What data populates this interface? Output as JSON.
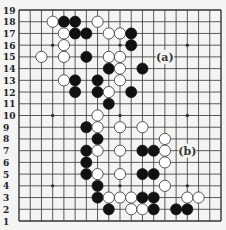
{
  "diagram": {
    "type": "go-board",
    "size": 19,
    "colors": {
      "background": "#f4f4f2",
      "line": "#333333",
      "black": "#111111",
      "white": "#ffffff"
    },
    "row_labels": [
      "19",
      "18",
      "17",
      "16",
      "15",
      "14",
      "13",
      "12",
      "11",
      "10",
      "9",
      "8",
      "7",
      "6",
      "5",
      "4",
      "3",
      "2",
      "1"
    ],
    "hoshi": [
      [
        4,
        4
      ],
      [
        4,
        10
      ],
      [
        4,
        16
      ],
      [
        10,
        4
      ],
      [
        10,
        10
      ],
      [
        10,
        16
      ],
      [
        16,
        4
      ],
      [
        16,
        10
      ],
      [
        16,
        16
      ]
    ],
    "stones": [
      {
        "c": 4,
        "r": 18,
        "color": "white"
      },
      {
        "c": 5,
        "r": 18,
        "color": "black"
      },
      {
        "c": 6,
        "r": 18,
        "color": "black"
      },
      {
        "c": 8,
        "r": 18,
        "color": "white"
      },
      {
        "c": 5,
        "r": 17,
        "color": "white"
      },
      {
        "c": 6,
        "r": 17,
        "color": "black"
      },
      {
        "c": 7,
        "r": 17,
        "color": "black"
      },
      {
        "c": 9,
        "r": 17,
        "color": "white"
      },
      {
        "c": 10,
        "r": 17,
        "color": "white"
      },
      {
        "c": 11,
        "r": 17,
        "color": "black"
      },
      {
        "c": 5,
        "r": 16,
        "color": "white"
      },
      {
        "c": 11,
        "r": 16,
        "color": "black"
      },
      {
        "c": 3,
        "r": 15,
        "color": "white"
      },
      {
        "c": 5,
        "r": 15,
        "color": "white"
      },
      {
        "c": 7,
        "r": 15,
        "color": "black"
      },
      {
        "c": 9,
        "r": 15,
        "color": "white"
      },
      {
        "c": 10,
        "r": 15,
        "color": "white"
      },
      {
        "c": 9,
        "r": 14,
        "color": "black"
      },
      {
        "c": 10,
        "r": 14,
        "color": "white"
      },
      {
        "c": 12,
        "r": 14,
        "color": "black"
      },
      {
        "c": 5,
        "r": 13,
        "color": "white"
      },
      {
        "c": 6,
        "r": 13,
        "color": "black"
      },
      {
        "c": 8,
        "r": 13,
        "color": "black"
      },
      {
        "c": 10,
        "r": 13,
        "color": "white"
      },
      {
        "c": 6,
        "r": 12,
        "color": "black"
      },
      {
        "c": 8,
        "r": 12,
        "color": "black"
      },
      {
        "c": 9,
        "r": 12,
        "color": "white"
      },
      {
        "c": 11,
        "r": 12,
        "color": "black"
      },
      {
        "c": 9,
        "r": 11,
        "color": "black"
      },
      {
        "c": 8,
        "r": 10,
        "color": "white"
      },
      {
        "c": 7,
        "r": 9,
        "color": "black"
      },
      {
        "c": 8,
        "r": 9,
        "color": "white"
      },
      {
        "c": 10,
        "r": 9,
        "color": "white"
      },
      {
        "c": 12,
        "r": 9,
        "color": "white"
      },
      {
        "c": 8,
        "r": 8,
        "color": "black"
      },
      {
        "c": 14,
        "r": 8,
        "color": "white"
      },
      {
        "c": 7,
        "r": 7,
        "color": "black"
      },
      {
        "c": 8,
        "r": 7,
        "color": "white"
      },
      {
        "c": 10,
        "r": 7,
        "color": "white"
      },
      {
        "c": 12,
        "r": 7,
        "color": "black"
      },
      {
        "c": 13,
        "r": 7,
        "color": "black"
      },
      {
        "c": 14,
        "r": 7,
        "color": "white"
      },
      {
        "c": 7,
        "r": 6,
        "color": "black"
      },
      {
        "c": 14,
        "r": 6,
        "color": "white"
      },
      {
        "c": 7,
        "r": 5,
        "color": "black"
      },
      {
        "c": 8,
        "r": 5,
        "color": "white"
      },
      {
        "c": 10,
        "r": 5,
        "color": "white"
      },
      {
        "c": 12,
        "r": 5,
        "color": "black"
      },
      {
        "c": 13,
        "r": 5,
        "color": "black"
      },
      {
        "c": 8,
        "r": 4,
        "color": "black"
      },
      {
        "c": 14,
        "r": 4,
        "color": "white"
      },
      {
        "c": 8,
        "r": 3,
        "color": "black"
      },
      {
        "c": 9,
        "r": 3,
        "color": "white"
      },
      {
        "c": 10,
        "r": 3,
        "color": "white"
      },
      {
        "c": 11,
        "r": 3,
        "color": "white"
      },
      {
        "c": 12,
        "r": 3,
        "color": "black"
      },
      {
        "c": 13,
        "r": 3,
        "color": "black"
      },
      {
        "c": 16,
        "r": 3,
        "color": "white"
      },
      {
        "c": 17,
        "r": 3,
        "color": "white"
      },
      {
        "c": 9,
        "r": 2,
        "color": "black"
      },
      {
        "c": 11,
        "r": 2,
        "color": "white"
      },
      {
        "c": 12,
        "r": 2,
        "color": "white"
      },
      {
        "c": 13,
        "r": 2,
        "color": "black"
      },
      {
        "c": 15,
        "r": 2,
        "color": "black"
      },
      {
        "c": 16,
        "r": 2,
        "color": "black"
      }
    ],
    "annotations": [
      {
        "c": 14,
        "r": 15,
        "text": "(a)"
      },
      {
        "c": 16,
        "r": 7,
        "text": "(b)"
      }
    ]
  }
}
